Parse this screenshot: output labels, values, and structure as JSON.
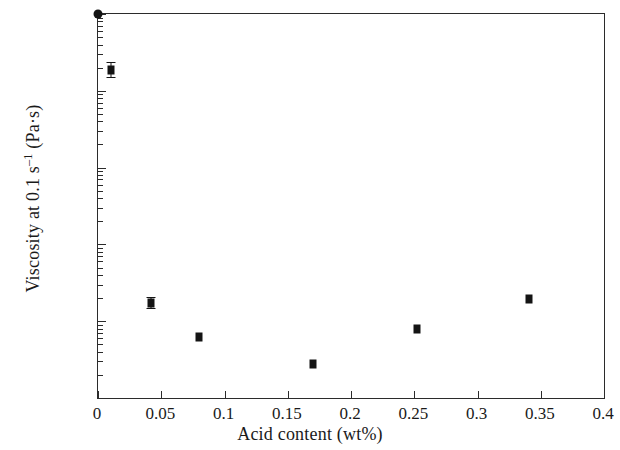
{
  "chart_data": {
    "type": "scatter",
    "title": "",
    "xlabel": "Acid content (wt%)",
    "ylabel": "Viscosity at 0.1 s⁻¹ (Pa·s)",
    "ylabel_parts": {
      "prefix": "Viscosity at 0.1 s",
      "exponent": "–1",
      "suffix": " (Pa·s)"
    },
    "xscale": "linear",
    "yscale": "log",
    "xlim": [
      0,
      0.4
    ],
    "ylim": [
      0.01,
      1000
    ],
    "grid": false,
    "legend": null,
    "xticks": [
      "0",
      "0.05",
      "0.1",
      "0.15",
      "0.2",
      "0.25",
      "0.3",
      "0.35",
      "0.4"
    ],
    "xtick_values": [
      0,
      0.05,
      0.1,
      0.15,
      0.2,
      0.25,
      0.3,
      0.35,
      0.4
    ],
    "yticks": [
      "1000",
      "100",
      "10",
      "1",
      "0.1",
      "0.01"
    ],
    "ytick_values": [
      1000,
      100,
      10,
      1,
      0.1,
      0.01
    ],
    "marker": "square",
    "marker_color": "#141414",
    "points": [
      {
        "x": 0.0,
        "y": 1000,
        "yerr_low": 0,
        "yerr_high": 0,
        "marker": "round"
      },
      {
        "x": 0.01,
        "y": 185,
        "yerr_low": 150,
        "yerr_high": 235,
        "marker": "square"
      },
      {
        "x": 0.042,
        "y": 0.175,
        "yerr_low": 0.15,
        "yerr_high": 0.205,
        "marker": "square"
      },
      {
        "x": 0.08,
        "y": 0.062,
        "yerr_low": 0.062,
        "yerr_high": 0.062,
        "marker": "square"
      },
      {
        "x": 0.17,
        "y": 0.028,
        "yerr_low": 0.028,
        "yerr_high": 0.028,
        "marker": "square"
      },
      {
        "x": 0.252,
        "y": 0.079,
        "yerr_low": 0.079,
        "yerr_high": 0.079,
        "marker": "square"
      },
      {
        "x": 0.341,
        "y": 0.192,
        "yerr_low": 0.192,
        "yerr_high": 0.192,
        "marker": "square"
      }
    ]
  }
}
